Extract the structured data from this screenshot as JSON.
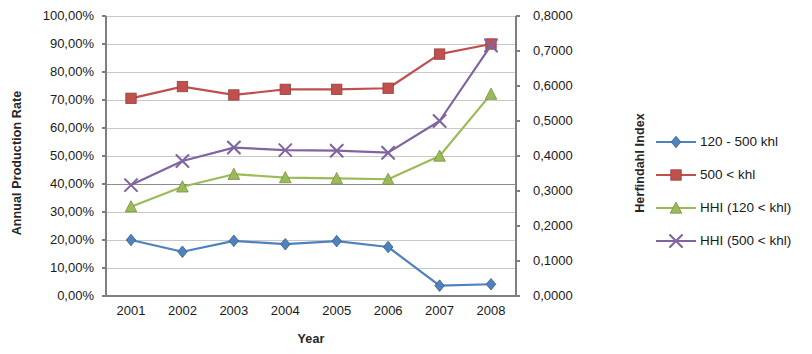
{
  "chart_data": {
    "type": "line",
    "title": "",
    "xlabel": "Year",
    "ylabel": "Annual Production Rate",
    "y2label": "Herfindahl Index",
    "x": [
      "2001",
      "2002",
      "2003",
      "2004",
      "2005",
      "2006",
      "2007",
      "2008"
    ],
    "ylim": [
      0,
      1.0
    ],
    "y2lim": [
      0,
      0.8
    ],
    "yticks": [
      "0,00%",
      "10,00%",
      "20,00%",
      "30,00%",
      "40,00%",
      "50,00%",
      "60,00%",
      "70,00%",
      "80,00%",
      "90,00%",
      "100,00%"
    ],
    "ytick_values": [
      0,
      10,
      20,
      30,
      40,
      50,
      60,
      70,
      80,
      90,
      100
    ],
    "y2ticks": [
      "0,0000",
      "0,1000",
      "0,2000",
      "0,3000",
      "0,4000",
      "0,5000",
      "0,6000",
      "0,7000",
      "0,8000"
    ],
    "y2tick_values": [
      0,
      0.1,
      0.2,
      0.3,
      0.4,
      0.5,
      0.6,
      0.7,
      0.8
    ],
    "grid": true,
    "legend_position": "right",
    "series": [
      {
        "name": "120 - 500 khl",
        "axis": "left",
        "color": "#4F81BD",
        "marker": "diamond",
        "values": [
          20.0,
          15.8,
          19.7,
          18.5,
          19.6,
          17.5,
          3.7,
          4.2
        ]
      },
      {
        "name": "500 < khl",
        "axis": "left",
        "color": "#C0504D",
        "marker": "square",
        "values": [
          70.6,
          74.8,
          71.8,
          73.8,
          73.8,
          74.2,
          86.4,
          90.0
        ]
      },
      {
        "name": "HHI (120 < khl)",
        "axis": "right",
        "color": "#9BBB59",
        "marker": "triangle",
        "values": [
          0.2552,
          0.312,
          0.348,
          0.3384,
          0.336,
          0.3336,
          0.4,
          0.5768
        ]
      },
      {
        "name": "HHI (500 < khl)",
        "axis": "right",
        "color": "#8064A2",
        "marker": "x",
        "values": [
          0.3168,
          0.3856,
          0.424,
          0.4168,
          0.4152,
          0.4096,
          0.5,
          0.716
        ]
      }
    ]
  },
  "legend": {
    "items": [
      {
        "label": "120 - 500 khl"
      },
      {
        "label": "500 < khl"
      },
      {
        "label": "HHI (120 < khl)"
      },
      {
        "label": "HHI (500 < khl)"
      }
    ]
  }
}
